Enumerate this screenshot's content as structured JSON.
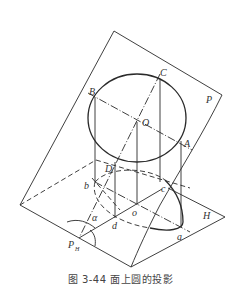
{
  "figure": {
    "caption": "图 3-44   面上圆的投影",
    "planes": {
      "inclined": "P",
      "horizontal": "H",
      "trace": "P",
      "trace_sub": "H"
    },
    "points": {
      "C": "C",
      "B": "B",
      "O": "O",
      "A": "A",
      "D": "D",
      "b": "b",
      "c": "c",
      "o": "o",
      "d": "d",
      "a": "a"
    },
    "angle": "α"
  },
  "colors": {
    "line": "#2a2a2a",
    "text": "#333333"
  }
}
